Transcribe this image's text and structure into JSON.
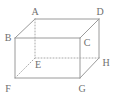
{
  "figure": {
    "kind": "geometry-diagram",
    "shape_name": "cuboid",
    "width": 117,
    "height": 100,
    "background_color": "#ffffff",
    "stroke_color": "#9a9a9a",
    "hidden_stroke_color": "#a8a8a8",
    "label_color": "#6f6f6f",
    "stroke_width": 1,
    "hidden_dash_pattern": "1,2"
  },
  "vertices": [
    {
      "id": "A",
      "label": "A",
      "x": 35,
      "y": 19,
      "label_x": 35,
      "label_y": 15,
      "hidden": false
    },
    {
      "id": "B",
      "label": "B",
      "x": 15,
      "y": 38,
      "label_x": 8,
      "label_y": 41,
      "hidden": false
    },
    {
      "id": "C",
      "label": "C",
      "x": 80,
      "y": 38,
      "label_x": 87,
      "label_y": 46,
      "hidden": false
    },
    {
      "id": "D",
      "label": "D",
      "x": 99,
      "y": 19,
      "label_x": 100,
      "label_y": 15,
      "hidden": false
    },
    {
      "id": "E",
      "label": "E",
      "x": 35,
      "y": 58,
      "label_x": 38,
      "label_y": 68,
      "hidden": true
    },
    {
      "id": "F",
      "label": "F",
      "x": 15,
      "y": 78,
      "label_x": 8,
      "label_y": 92,
      "hidden": false
    },
    {
      "id": "G",
      "label": "G",
      "x": 80,
      "y": 78,
      "label_x": 82,
      "label_y": 92,
      "hidden": false
    },
    {
      "id": "H",
      "label": "H",
      "x": 99,
      "y": 58,
      "label_x": 106,
      "label_y": 66,
      "hidden": false
    }
  ],
  "edges": [
    {
      "id": "AB",
      "from": "A",
      "to": "B",
      "x1": 35,
      "y1": 19,
      "x2": 15,
      "y2": 38,
      "style": "solid"
    },
    {
      "id": "AD",
      "from": "A",
      "to": "D",
      "x1": 35,
      "y1": 19,
      "x2": 99,
      "y2": 19,
      "style": "solid"
    },
    {
      "id": "DC",
      "from": "D",
      "to": "C",
      "x1": 99,
      "y1": 19,
      "x2": 80,
      "y2": 38,
      "style": "solid"
    },
    {
      "id": "DH",
      "from": "D",
      "to": "H",
      "x1": 99,
      "y1": 19,
      "x2": 99,
      "y2": 58,
      "style": "solid"
    },
    {
      "id": "BC",
      "from": "B",
      "to": "C",
      "x1": 15,
      "y1": 38,
      "x2": 80,
      "y2": 38,
      "style": "solid"
    },
    {
      "id": "BF",
      "from": "B",
      "to": "F",
      "x1": 15,
      "y1": 38,
      "x2": 15,
      "y2": 78,
      "style": "solid"
    },
    {
      "id": "CG",
      "from": "C",
      "to": "G",
      "x1": 80,
      "y1": 38,
      "x2": 80,
      "y2": 78,
      "style": "solid"
    },
    {
      "id": "FG",
      "from": "F",
      "to": "G",
      "x1": 15,
      "y1": 78,
      "x2": 80,
      "y2": 78,
      "style": "solid"
    },
    {
      "id": "GH",
      "from": "G",
      "to": "H",
      "x1": 80,
      "y1": 78,
      "x2": 99,
      "y2": 58,
      "style": "solid"
    },
    {
      "id": "AE",
      "from": "A",
      "to": "E",
      "x1": 35,
      "y1": 19,
      "x2": 35,
      "y2": 58,
      "style": "dotted"
    },
    {
      "id": "EH",
      "from": "E",
      "to": "H",
      "x1": 35,
      "y1": 58,
      "x2": 99,
      "y2": 58,
      "style": "dotted"
    },
    {
      "id": "EF",
      "from": "E",
      "to": "F",
      "x1": 35,
      "y1": 58,
      "x2": 15,
      "y2": 78,
      "style": "dotted"
    }
  ]
}
